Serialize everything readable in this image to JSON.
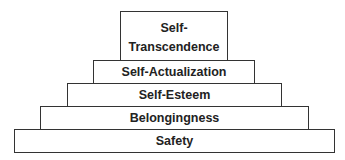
{
  "diagram": {
    "type": "pyramid",
    "tiers": [
      {
        "line1": "Self-",
        "line2": "Transcendence"
      },
      {
        "label": "Self-Actualization"
      },
      {
        "label": "Self-Esteem"
      },
      {
        "label": "Belongingness"
      },
      {
        "label": "Safety"
      }
    ],
    "colors": {
      "border": "#333333",
      "fill": "#ffffff",
      "text": "#222222"
    }
  }
}
